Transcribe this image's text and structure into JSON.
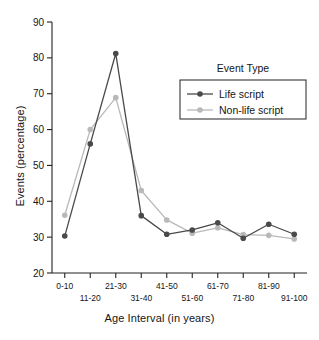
{
  "chart_data": {
    "type": "line",
    "title": "",
    "xlabel": "Age Interval (in years)",
    "ylabel": "Events (percentage)",
    "categories": [
      "0-10",
      "11-20",
      "21-30",
      "31-40",
      "41-50",
      "51-60",
      "61-70",
      "71-80",
      "81-90",
      "91-100"
    ],
    "ylim": [
      20,
      90
    ],
    "yticks": [
      20,
      30,
      40,
      50,
      60,
      70,
      80,
      90
    ],
    "ytick_labels": [
      "20",
      "30",
      "40",
      "50",
      "60",
      "70",
      "80",
      "90"
    ],
    "grid": false,
    "legend_position": "upper right",
    "legend_title": "Event Type",
    "series": [
      {
        "name": "Life script",
        "color": "#4a4a4a",
        "values": [
          30.3,
          56.0,
          81.2,
          36.0,
          30.8,
          32.0,
          34.0,
          29.7,
          33.6,
          30.8
        ]
      },
      {
        "name": "Non-life script",
        "color": "#b9b9b9",
        "values": [
          36.1,
          60.0,
          68.9,
          43.0,
          34.8,
          31.1,
          32.6,
          30.7,
          30.5,
          29.5
        ]
      }
    ]
  },
  "axes": {
    "y_axis_title": "Events (percentage)",
    "x_axis_title": "Age Interval (in years)"
  },
  "legend": {
    "title": "Event Type",
    "items": [
      {
        "label": "Life script",
        "color": "#4a4a4a"
      },
      {
        "label": "Non-life script",
        "color": "#b9b9b9"
      }
    ]
  }
}
